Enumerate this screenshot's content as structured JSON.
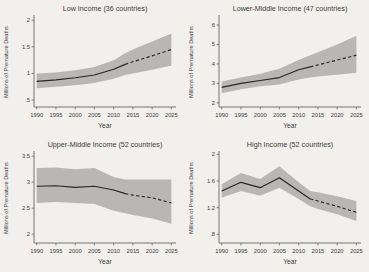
{
  "page": {
    "background": "#f1f0ed",
    "band_color": "#b9b7b4",
    "line_color": "#262626",
    "axis_color": "#5a5751",
    "text_color": "#403d39"
  },
  "chart_data": [
    {
      "type": "line",
      "title": "Low Income (36 countries)",
      "xlabel": "Year",
      "ylabel": "Millions of Premature Deaths",
      "x": [
        1990,
        1995,
        2000,
        2005,
        2010,
        2013,
        2015,
        2020,
        2025
      ],
      "series": [
        {
          "name": "mean-premature-deaths",
          "values": [
            0.85,
            0.88,
            0.92,
            0.97,
            1.08,
            1.17,
            1.22,
            1.33,
            1.45
          ]
        }
      ],
      "band": {
        "name": "uncertainty-band",
        "lower": [
          0.72,
          0.75,
          0.78,
          0.82,
          0.9,
          0.97,
          1.0,
          1.07,
          1.15
        ],
        "upper": [
          1.0,
          1.02,
          1.06,
          1.12,
          1.25,
          1.38,
          1.45,
          1.6,
          1.75
        ]
      },
      "solid_until_x": 2013,
      "xticks": [
        1990,
        1995,
        2000,
        2005,
        2010,
        2015,
        2020,
        2025
      ],
      "xtick_labels": [
        "1990",
        "1995",
        "2000",
        "2005",
        "2010",
        "2015",
        "2020",
        "2025"
      ],
      "yticks": [
        0.5,
        1.0,
        1.5,
        2.0
      ],
      "ytick_labels": [
        ".5",
        "1",
        "1.5",
        "2"
      ],
      "xlim": [
        1989.3,
        2026.2
      ],
      "ylim": [
        0.37,
        2.06
      ],
      "grid": false,
      "legend": "none"
    },
    {
      "type": "line",
      "title": "Lower-Middle Income (47 countries)",
      "xlabel": "Year",
      "ylabel": "Millions of Premature Deaths",
      "x": [
        1990,
        1995,
        2000,
        2005,
        2010,
        2013,
        2015,
        2020,
        2025
      ],
      "series": [
        {
          "name": "mean-premature-deaths",
          "values": [
            2.8,
            3.0,
            3.15,
            3.3,
            3.7,
            3.85,
            3.95,
            4.2,
            4.45
          ]
        }
      ],
      "band": {
        "name": "uncertainty-band",
        "lower": [
          2.5,
          2.7,
          2.85,
          2.95,
          3.2,
          3.3,
          3.35,
          3.45,
          3.55
        ],
        "upper": [
          3.1,
          3.3,
          3.5,
          3.75,
          4.2,
          4.45,
          4.6,
          5.0,
          5.45
        ]
      },
      "solid_until_x": 2013,
      "xticks": [
        1990,
        1995,
        2000,
        2005,
        2010,
        2015,
        2020,
        2025
      ],
      "xtick_labels": [
        "1990",
        "1995",
        "2000",
        "2005",
        "2010",
        "2015",
        "2020",
        "2025"
      ],
      "yticks": [
        2,
        3,
        4,
        5,
        6
      ],
      "ytick_labels": [
        "2",
        "3",
        "4",
        "5",
        "6"
      ],
      "xlim": [
        1989.3,
        2026.2
      ],
      "ylim": [
        1.79,
        6.41
      ],
      "grid": false,
      "legend": "none"
    },
    {
      "type": "line",
      "title": "Upper-Middle Income (52 countries)",
      "xlabel": "Year",
      "ylabel": "Millions of Premature Deaths",
      "x": [
        1990,
        1995,
        2000,
        2005,
        2010,
        2013,
        2015,
        2020,
        2025
      ],
      "series": [
        {
          "name": "mean-premature-deaths",
          "values": [
            2.92,
            2.93,
            2.9,
            2.92,
            2.85,
            2.78,
            2.75,
            2.7,
            2.6
          ]
        }
      ],
      "band": {
        "name": "uncertainty-band",
        "lower": [
          2.6,
          2.62,
          2.6,
          2.58,
          2.45,
          2.4,
          2.37,
          2.3,
          2.2
        ],
        "upper": [
          3.27,
          3.28,
          3.25,
          3.27,
          3.1,
          3.05,
          3.05,
          3.05,
          3.05
        ]
      },
      "solid_until_x": 2013,
      "xticks": [
        1990,
        1995,
        2000,
        2005,
        2010,
        2015,
        2020,
        2025
      ],
      "xtick_labels": [
        "1990",
        "1995",
        "2000",
        "2005",
        "2010",
        "2015",
        "2020",
        "2025"
      ],
      "yticks": [
        2.0,
        2.5,
        3.0,
        3.5
      ],
      "ytick_labels": [
        "2",
        "2.5",
        "3",
        "3.5"
      ],
      "xlim": [
        1989.3,
        2026.2
      ],
      "ylim": [
        1.83,
        3.56
      ],
      "grid": false,
      "legend": "none"
    },
    {
      "type": "line",
      "title": "High Income (52 countries)",
      "xlabel": "Year",
      "ylabel": "Millions of Premature Deaths",
      "x": [
        1990,
        1995,
        2000,
        2005,
        2010,
        2013,
        2015,
        2020,
        2025
      ],
      "series": [
        {
          "name": "mean-premature-deaths",
          "values": [
            1.45,
            1.58,
            1.5,
            1.65,
            1.45,
            1.33,
            1.3,
            1.22,
            1.13
          ]
        }
      ],
      "band": {
        "name": "uncertainty-band",
        "lower": [
          1.35,
          1.45,
          1.38,
          1.5,
          1.33,
          1.22,
          1.18,
          1.1,
          1.0
        ],
        "upper": [
          1.55,
          1.72,
          1.63,
          1.82,
          1.58,
          1.45,
          1.43,
          1.37,
          1.3
        ]
      },
      "solid_until_x": 2013,
      "xticks": [
        1990,
        1995,
        2000,
        2005,
        2010,
        2015,
        2020,
        2025
      ],
      "xtick_labels": [
        "1990",
        "1995",
        "2000",
        "2005",
        "2010",
        "2015",
        "2020",
        "2025"
      ],
      "yticks": [
        0.8,
        1.2,
        1.6,
        2.0
      ],
      "ytick_labels": [
        ".8",
        "1.2",
        "1.6",
        "2"
      ],
      "xlim": [
        1989.3,
        2026.2
      ],
      "ylim": [
        0.67,
        2.02
      ],
      "grid": false,
      "legend": "none"
    }
  ]
}
